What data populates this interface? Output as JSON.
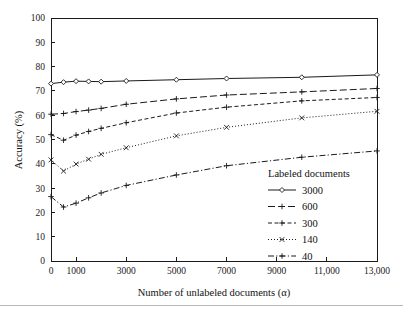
{
  "chart_data": {
    "type": "line",
    "title": "",
    "xlabel": "Number of unlabeled documents (α)",
    "ylabel": "Accuracy (%)",
    "xlim": [
      0,
      13000
    ],
    "ylim": [
      0,
      100
    ],
    "grid": false,
    "legend_position": "inside-lower-right",
    "legend_title": "Labeled documents",
    "x_tick_labels": [
      "0",
      "1000",
      "3000",
      "5000",
      "7000",
      "9000",
      "11,000",
      "13,000"
    ],
    "x_tick_values": [
      0,
      1000,
      3000,
      5000,
      7000,
      9000,
      11000,
      13000
    ],
    "y_tick_labels": [
      "0",
      "10",
      "20",
      "30",
      "40",
      "50",
      "60",
      "70",
      "80",
      "90",
      "100"
    ],
    "y_tick_values": [
      0,
      10,
      20,
      30,
      40,
      50,
      60,
      70,
      80,
      90,
      100
    ],
    "x": [
      0,
      500,
      1000,
      1500,
      2000,
      3000,
      5000,
      7000,
      10000,
      13000
    ],
    "series": [
      {
        "name": "3000",
        "marker": "diamond",
        "dash": "solid",
        "values": [
          73.0,
          73.6,
          74.0,
          73.9,
          73.8,
          74.1,
          74.6,
          75.1,
          75.6,
          76.6
        ]
      },
      {
        "name": "600",
        "marker": "plus",
        "dash": "dashed-long",
        "values": [
          60.4,
          60.7,
          61.5,
          62.1,
          62.8,
          64.5,
          66.7,
          68.3,
          69.6,
          71.0
        ]
      },
      {
        "name": "300",
        "marker": "plus",
        "dash": "dashed-short",
        "values": [
          52.0,
          49.7,
          51.8,
          53.3,
          54.6,
          56.9,
          60.9,
          63.3,
          65.9,
          67.3
        ]
      },
      {
        "name": "140",
        "marker": "cross",
        "dash": "dotted",
        "values": [
          41.6,
          37.0,
          39.9,
          41.9,
          43.9,
          46.6,
          51.5,
          55.0,
          58.9,
          61.6
        ]
      },
      {
        "name": "40",
        "marker": "plus",
        "dash": "dash-dot",
        "values": [
          26.5,
          22.2,
          23.8,
          26.0,
          28.0,
          31.1,
          35.4,
          39.2,
          42.7,
          45.3
        ]
      }
    ]
  },
  "colors": {
    "ink": "#1a1a1a",
    "background": "#ffffff",
    "rule": "#b9b9b9"
  }
}
